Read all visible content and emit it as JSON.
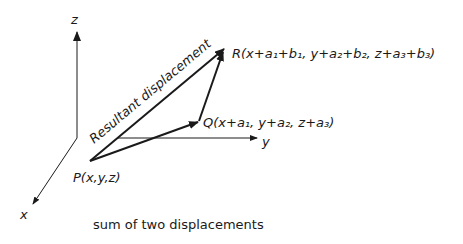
{
  "axes": {
    "z_label": "z",
    "y_label": "y",
    "x_label": "x"
  },
  "points": {
    "P": "P(x,y,z)",
    "Q": "Q(x+a₁, y+a₂, z+a₃)",
    "R": "R(x+a₁+b₁, y+a₂+b₂, z+a₃+b₃)"
  },
  "vectors": {
    "resultant_label": "Resultant displacement"
  },
  "caption": "sum of two displacements",
  "colors": {
    "ink": "#1a1a1a",
    "background": "#ffffff"
  }
}
